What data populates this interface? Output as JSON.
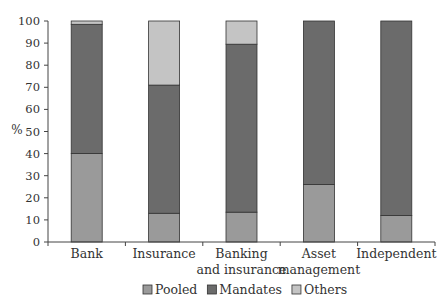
{
  "chart_data": {
    "type": "bar",
    "stacked": true,
    "title": "",
    "xlabel": "",
    "ylabel": "%",
    "ylim": [
      0,
      100
    ],
    "yticks": [
      0,
      10,
      20,
      30,
      40,
      50,
      60,
      70,
      80,
      90,
      100
    ],
    "grid": false,
    "legend_position": "bottom",
    "categories": [
      "Bank",
      "Insurance",
      "Banking and insurance",
      "Asset management",
      "Independent"
    ],
    "category_lines": [
      [
        "Bank"
      ],
      [
        "Insurance"
      ],
      [
        "Banking",
        "and insurance"
      ],
      [
        "Asset",
        "management"
      ],
      [
        "Independent"
      ]
    ],
    "series": [
      {
        "name": "Pooled",
        "color": "#9a9a9a",
        "values": [
          40,
          13,
          13.5,
          26,
          12
        ]
      },
      {
        "name": "Mandates",
        "color": "#6b6b6b",
        "values": [
          58.5,
          58,
          76,
          74,
          88
        ]
      },
      {
        "name": "Others",
        "color": "#c4c4c4",
        "values": [
          1.5,
          29,
          10.5,
          0,
          0
        ]
      }
    ]
  }
}
